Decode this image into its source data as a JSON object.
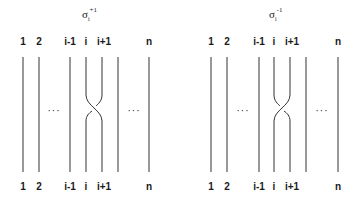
{
  "diagrams": [
    {
      "name": "sigma-positive",
      "title": {
        "base": "σ",
        "sub": "i",
        "sup": "+1"
      },
      "top_labels": [
        "1",
        "2",
        "i-1",
        "i",
        "i+1",
        "n"
      ],
      "bottom_labels": [
        "1",
        "2",
        "i-1",
        "i",
        "i+1",
        "n"
      ],
      "ellipsis_left": "···",
      "ellipsis_right": "···",
      "crossing": "positive (left-over-right)"
    },
    {
      "name": "sigma-negative",
      "title": {
        "base": "σ",
        "sub": "i",
        "sup": "-1"
      },
      "top_labels": [
        "1",
        "2",
        "i-1",
        "i",
        "i+1",
        "n"
      ],
      "bottom_labels": [
        "1",
        "2",
        "i-1",
        "i",
        "i+1",
        "n"
      ],
      "ellipsis_left": "···",
      "ellipsis_right": "···",
      "crossing": "negative (right-over-left)"
    }
  ],
  "colors": {
    "stroke": "#333333",
    "text": "#1a1a1a",
    "background": "#ffffff"
  }
}
